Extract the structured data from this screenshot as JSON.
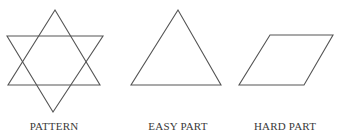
{
  "figure": {
    "stroke_color": "#555555",
    "panels": [
      {
        "id": "pattern",
        "label": "PATTERN",
        "shape": "hexagram",
        "triangles": [
          [
            [
              55,
              10
            ],
            [
              8,
              85
            ],
            [
              100,
              85
            ]
          ],
          [
            [
              7,
              36
            ],
            [
              103,
              36
            ],
            [
              53,
              112
            ]
          ]
        ]
      },
      {
        "id": "easy",
        "label": "EASY PART",
        "shape": "triangle",
        "points": [
          [
            178,
            10
          ],
          [
            131,
            85
          ],
          [
            221,
            85
          ]
        ]
      },
      {
        "id": "hard",
        "label": "HARD PART",
        "shape": "parallelogram",
        "points": [
          [
            270,
            35
          ],
          [
            333,
            35
          ],
          [
            304,
            85
          ],
          [
            239,
            85
          ]
        ]
      }
    ]
  }
}
